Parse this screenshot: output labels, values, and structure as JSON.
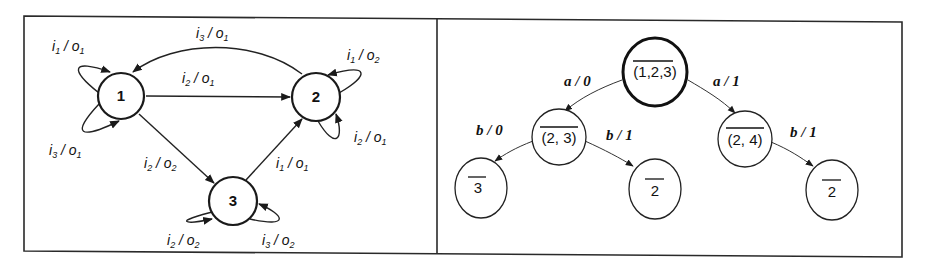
{
  "left_panel": {
    "title": "Finite state machine",
    "states": [
      {
        "id": "1",
        "label": "1"
      },
      {
        "id": "2",
        "label": "2"
      },
      {
        "id": "3",
        "label": "3"
      }
    ],
    "transitions": [
      {
        "from": "1",
        "to": "1",
        "input": "i",
        "input_sub": "1",
        "output": "o",
        "output_sub": "1",
        "label": "i1 / o1"
      },
      {
        "from": "1",
        "to": "1",
        "input": "i",
        "input_sub": "3",
        "output": "o",
        "output_sub": "1",
        "label": "i3 / o1"
      },
      {
        "from": "1",
        "to": "2",
        "input": "i",
        "input_sub": "2",
        "output": "o",
        "output_sub": "1",
        "label": "i2 / o1"
      },
      {
        "from": "2",
        "to": "1",
        "input": "i",
        "input_sub": "3",
        "output": "o",
        "output_sub": "1",
        "label": "i3 / o1"
      },
      {
        "from": "2",
        "to": "2",
        "input": "i",
        "input_sub": "1",
        "output": "o",
        "output_sub": "2",
        "label": "i1 / o2"
      },
      {
        "from": "2",
        "to": "2",
        "input": "i",
        "input_sub": "2",
        "output": "o",
        "output_sub": "1",
        "label": "i2 / o1"
      },
      {
        "from": "1",
        "to": "3",
        "input": "i",
        "input_sub": "2",
        "output": "o",
        "output_sub": "2",
        "label": "i2 / o2"
      },
      {
        "from": "3",
        "to": "2",
        "input": "i",
        "input_sub": "1",
        "output": "o",
        "output_sub": "1",
        "label": "i1 / o1"
      },
      {
        "from": "3",
        "to": "3",
        "input": "i",
        "input_sub": "2",
        "output": "o",
        "output_sub": "2",
        "label": "i2 / o2"
      },
      {
        "from": "3",
        "to": "3",
        "input": "i",
        "input_sub": "3",
        "output": "o",
        "output_sub": "2",
        "label": "i3 / o2"
      }
    ]
  },
  "right_panel": {
    "title": "Distinguishing tree",
    "nodes": [
      {
        "id": "root",
        "label": "(1,2,3)",
        "overlined": true
      },
      {
        "id": "n23",
        "label": "(2, 3)",
        "overlined": true
      },
      {
        "id": "n24",
        "label": "(2, 4)",
        "overlined": true
      },
      {
        "id": "leaf3",
        "label": "3",
        "overlined": true
      },
      {
        "id": "leaf2a",
        "label": "2",
        "overlined": true
      },
      {
        "id": "leaf2b",
        "label": "2",
        "overlined": true
      }
    ],
    "edges": [
      {
        "from": "root",
        "to": "n23",
        "input": "a",
        "output": "0",
        "label": "a / 0"
      },
      {
        "from": "root",
        "to": "n24",
        "input": "a",
        "output": "1",
        "label": "a / 1"
      },
      {
        "from": "n23",
        "to": "leaf3",
        "input": "b",
        "output": "0",
        "label": "b / 0"
      },
      {
        "from": "n23",
        "to": "leaf2a",
        "input": "b",
        "output": "1",
        "label": "b / 1"
      },
      {
        "from": "n24",
        "to": "leaf2b",
        "input": "b",
        "output": "1",
        "label": "b / 1"
      }
    ]
  }
}
